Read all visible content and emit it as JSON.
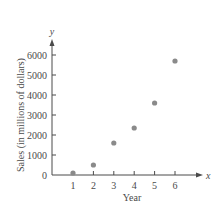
{
  "chart_data": {
    "type": "scatter",
    "title": "",
    "xlabel": "Year",
    "ylabel": "Sales (in millions of dollars)",
    "x_axis_var": "x",
    "y_axis_var": "y",
    "x": [
      1,
      2,
      3,
      4,
      5,
      6
    ],
    "y": [
      100,
      500,
      1600,
      2350,
      3600,
      5700
    ],
    "series": [
      {
        "name": "Sales",
        "x": [
          1,
          2,
          3,
          4,
          5,
          6
        ],
        "values": [
          100,
          500,
          1600,
          2350,
          3600,
          5700
        ]
      }
    ],
    "xticks": [
      1,
      2,
      3,
      4,
      5,
      6
    ],
    "yticks": [
      0,
      1000,
      2000,
      3000,
      4000,
      5000,
      6000
    ],
    "xlim": [
      0.05,
      7.3
    ],
    "ylim": [
      0,
      6700
    ],
    "grid": false,
    "legend": null,
    "point_color": "#8a8a8a",
    "axis_color": "#4a4a4a"
  }
}
